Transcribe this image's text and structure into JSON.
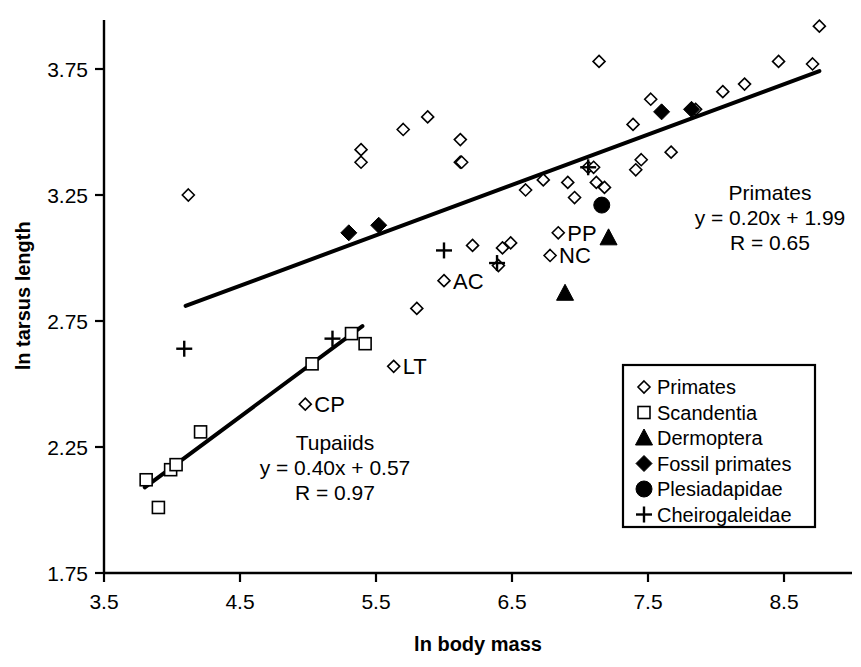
{
  "figure": {
    "title": "",
    "background": "#ffffff",
    "foreground": "#000000"
  },
  "axes": {
    "x_title": "ln body mass",
    "y_title": "ln tarsus length",
    "x_ticks": [
      "3.5",
      "4.5",
      "5.5",
      "6.5",
      "7.5",
      "8.5"
    ],
    "y_ticks": [
      "3.75",
      "3.25",
      "2.75",
      "2.25",
      "1.75"
    ]
  },
  "annotations": {
    "primates": {
      "group": "Primates",
      "equation": "y = 0.20x + 1.99",
      "correlation": "R = 0.65"
    },
    "tupaiids": {
      "group": "Tupaiids",
      "equation": "y = 0.40x + 0.57",
      "correlation": "R = 0.97"
    },
    "point_labels": [
      {
        "text": "AC",
        "x": 6.0,
        "y": 2.91
      },
      {
        "text": "LT",
        "x": 5.63,
        "y": 2.57
      },
      {
        "text": "CP",
        "x": 4.98,
        "y": 2.42
      },
      {
        "text": "PP",
        "x": 6.84,
        "y": 3.1
      },
      {
        "text": "NC",
        "x": 6.78,
        "y": 3.01
      }
    ]
  },
  "legend": {
    "entries": [
      {
        "label": "Primates",
        "marker": "open-diamond"
      },
      {
        "label": "Scandentia",
        "marker": "open-square"
      },
      {
        "label": "Dermoptera",
        "marker": "solid-triangle"
      },
      {
        "label": "Fossil primates",
        "marker": "solid-diamond"
      },
      {
        "label": "Plesiadapidae",
        "marker": "solid-circle"
      },
      {
        "label": "Cheirogaleidae",
        "marker": "plus"
      }
    ]
  },
  "chart_data": {
    "type": "scatter",
    "title": "",
    "xlabel": "ln body mass",
    "ylabel": "ln tarsus length",
    "xlim": [
      3.2,
      8.9
    ],
    "ylim": [
      1.75,
      3.95
    ],
    "xticks": [
      3.5,
      4.5,
      5.5,
      6.5,
      7.5,
      8.5
    ],
    "yticks": [
      1.75,
      2.25,
      2.75,
      3.25,
      3.75
    ],
    "grid": false,
    "legend_position": "lower-right",
    "series": [
      {
        "name": "Primates",
        "marker": "open-diamond",
        "points": [
          [
            4.12,
            3.25
          ],
          [
            4.98,
            2.42
          ],
          [
            5.39,
            3.43
          ],
          [
            5.39,
            3.38
          ],
          [
            5.7,
            3.51
          ],
          [
            5.88,
            3.56
          ],
          [
            6.12,
            3.47
          ],
          [
            6.12,
            3.38
          ],
          [
            5.63,
            2.57
          ],
          [
            5.8,
            2.8
          ],
          [
            6.0,
            2.91
          ],
          [
            6.13,
            3.38
          ],
          [
            6.21,
            3.05
          ],
          [
            6.4,
            2.97
          ],
          [
            6.43,
            3.04
          ],
          [
            6.49,
            3.06
          ],
          [
            6.6,
            3.27
          ],
          [
            6.73,
            3.31
          ],
          [
            6.84,
            3.1
          ],
          [
            6.78,
            3.01
          ],
          [
            6.91,
            3.3
          ],
          [
            6.96,
            3.24
          ],
          [
            7.06,
            3.36
          ],
          [
            7.1,
            3.36
          ],
          [
            7.12,
            3.3
          ],
          [
            7.18,
            3.28
          ],
          [
            7.39,
            3.53
          ],
          [
            7.41,
            3.35
          ],
          [
            7.45,
            3.39
          ],
          [
            7.52,
            3.63
          ],
          [
            7.67,
            3.42
          ],
          [
            7.85,
            3.59
          ],
          [
            8.05,
            3.66
          ],
          [
            8.21,
            3.69
          ],
          [
            8.46,
            3.78
          ],
          [
            8.76,
            3.92
          ],
          [
            8.71,
            3.77
          ],
          [
            7.14,
            3.78
          ]
        ]
      },
      {
        "name": "Scandentia",
        "marker": "open-square",
        "points": [
          [
            3.81,
            2.12
          ],
          [
            3.9,
            2.01
          ],
          [
            3.99,
            2.16
          ],
          [
            4.21,
            2.31
          ],
          [
            4.03,
            2.18
          ],
          [
            5.03,
            2.58
          ],
          [
            5.32,
            2.7
          ],
          [
            5.42,
            2.66
          ]
        ]
      },
      {
        "name": "Dermoptera",
        "marker": "solid-triangle",
        "points": [
          [
            7.21,
            3.08
          ],
          [
            6.89,
            2.86
          ]
        ]
      },
      {
        "name": "Fossil primates",
        "marker": "solid-diamond",
        "points": [
          [
            5.3,
            3.1
          ],
          [
            5.52,
            3.13
          ],
          [
            7.6,
            3.58
          ],
          [
            7.82,
            3.59
          ]
        ]
      },
      {
        "name": "Plesiadapidae",
        "marker": "solid-circle",
        "points": [
          [
            7.16,
            3.21
          ]
        ]
      },
      {
        "name": "Cheirogaleidae",
        "marker": "plus",
        "points": [
          [
            4.09,
            2.64
          ],
          [
            5.18,
            2.68
          ],
          [
            6.0,
            3.03
          ],
          [
            6.39,
            2.98
          ],
          [
            7.06,
            3.36
          ]
        ]
      }
    ],
    "fits": [
      {
        "name": "Primates",
        "slope": 0.2,
        "intercept": 1.99,
        "r": 0.65,
        "x_range": [
          4.1,
          8.76
        ]
      },
      {
        "name": "Tupaiids",
        "slope": 0.4,
        "intercept": 0.57,
        "r": 0.97,
        "x_range": [
          3.8,
          5.4
        ]
      }
    ]
  }
}
